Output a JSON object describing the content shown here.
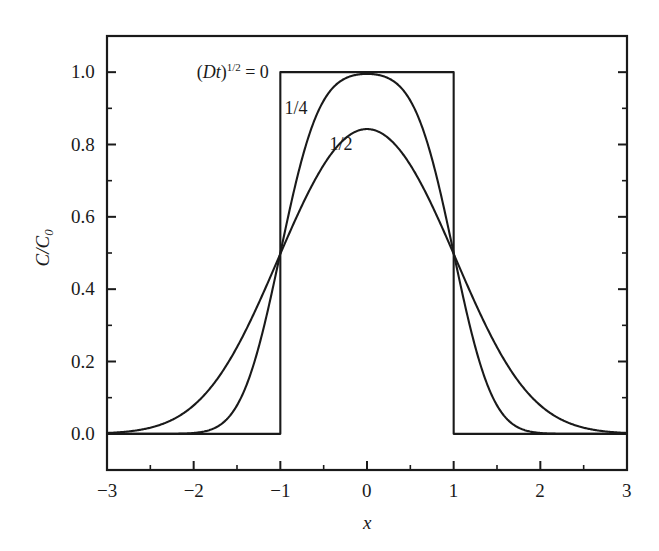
{
  "chart_data": {
    "type": "line",
    "title": "",
    "subtitle": "",
    "xlabel": "x",
    "ylabel": "C/C0",
    "ylabel_display": "C/C₀",
    "xlim": [
      -3,
      3
    ],
    "ylim": [
      -0.1,
      1.1
    ],
    "x_ticks": [
      -3,
      -2,
      -1,
      0,
      1,
      2,
      3
    ],
    "x_tick_labels": [
      "−3",
      "−2",
      "−1",
      "0",
      "1",
      "2",
      "3"
    ],
    "x_minor_ticks": [
      -2.5,
      -1.5,
      -0.5,
      0.5,
      1.5,
      2.5
    ],
    "y_ticks": [
      0.0,
      0.2,
      0.4,
      0.6,
      0.8,
      1.0
    ],
    "y_tick_labels": [
      "0.0",
      "0.2",
      "0.4",
      "0.6",
      "0.8",
      "1.0"
    ],
    "y_minor_ticks": [
      0.1,
      0.3,
      0.5,
      0.7,
      0.9
    ],
    "grid": false,
    "legend_position": "inline-annotations",
    "frame": "box",
    "line_color": "#1a1a1a",
    "background_color": "#ffffff",
    "annotations": [
      {
        "id": "sqrt-Dt-zero",
        "text": "(Dt)^{1/2} = 0",
        "html": "(<span class=\"it\">Dt</span>)<sup>1/2</sup> = 0",
        "x": -1.55,
        "y": 1.0
      },
      {
        "id": "quarter",
        "text": "1/4",
        "x": -0.82,
        "y": 0.9
      },
      {
        "id": "half",
        "text": "1/2",
        "x": -0.3,
        "y": 0.8
      }
    ],
    "series": [
      {
        "name": "(Dt)^{1/2} = 0",
        "sqrt_Dt": 0,
        "description": "Initial rectangular step: C/C0 = 1 for |x| < 1, 0 elsewhere",
        "peak_value": 1.0,
        "x": [
          -3,
          -1,
          -1,
          1,
          1,
          3
        ],
        "values": [
          0,
          0,
          1,
          1,
          0,
          0
        ]
      },
      {
        "name": "(Dt)^{1/2} = 1/4",
        "sqrt_Dt": 0.25,
        "description": "Error-function broadened profile, half-width parameter 1/4",
        "peak_value": 0.977,
        "x": [
          -3.0,
          -2.75,
          -2.5,
          -2.25,
          -2.0,
          -1.75,
          -1.5,
          -1.25,
          -1.0,
          -0.75,
          -0.5,
          -0.25,
          0.0,
          0.25,
          0.5,
          0.75,
          1.0,
          1.25,
          1.5,
          1.75,
          2.0,
          2.25,
          2.5,
          2.75,
          3.0
        ],
        "values": [
          0.0,
          0.0,
          0.0,
          0.0,
          0.0,
          0.001,
          0.023,
          0.16,
          0.488,
          0.841,
          0.954,
          0.974,
          0.977,
          0.974,
          0.954,
          0.841,
          0.488,
          0.16,
          0.023,
          0.001,
          0.0,
          0.0,
          0.0,
          0.0,
          0.0
        ]
      },
      {
        "name": "(Dt)^{1/2} = 1/2",
        "sqrt_Dt": 0.5,
        "description": "Error-function broadened profile, half-width parameter 1/2",
        "peak_value": 0.838,
        "x": [
          -3.0,
          -2.75,
          -2.5,
          -2.25,
          -2.0,
          -1.75,
          -1.5,
          -1.25,
          -1.0,
          -0.75,
          -0.5,
          -0.25,
          0.0,
          0.25,
          0.5,
          0.75,
          1.0,
          1.25,
          1.5,
          1.75,
          2.0,
          2.25,
          2.5,
          2.75,
          3.0
        ],
        "values": [
          0.005,
          0.011,
          0.024,
          0.048,
          0.09,
          0.157,
          0.25,
          0.363,
          0.48,
          0.6,
          0.7,
          0.79,
          0.838,
          0.79,
          0.7,
          0.6,
          0.48,
          0.363,
          0.25,
          0.157,
          0.09,
          0.048,
          0.024,
          0.011,
          0.005
        ]
      }
    ],
    "crossing_points": [
      {
        "x": -1,
        "y": 0.5,
        "note": "all curves intersect near C/C0 = 0.5"
      },
      {
        "x": 1,
        "y": 0.5,
        "note": "all curves intersect near C/C0 = 0.5"
      }
    ]
  }
}
